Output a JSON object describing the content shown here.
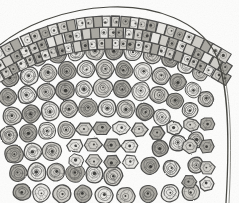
{
  "figure": {
    "kind": "histological-micrograph",
    "title": "",
    "caption": "",
    "label": "",
    "width_px": 239,
    "height_px": 203,
    "background_color": "#fdfdfc",
    "ink_color": "#4a4a48",
    "ink_color_dark": "#2b2b29",
    "fill_light": "#e8e7e3",
    "fill_mid": "#cfcdc7",
    "fill_dark": "#a9a7a0",
    "rendering": "grayscale line engraving / stipple"
  },
  "regions": [
    {
      "name": "epidermis",
      "description": "outer curved band of rectangular cells, 2 rows",
      "row_count": 2,
      "cell_shape": "rectangular"
    },
    {
      "name": "hypodermis",
      "description": "third row of smaller rectangular cells beneath epidermis",
      "row_count": 1,
      "cell_shape": "rectangular"
    },
    {
      "name": "cortex",
      "description": "bulk of section, rounded parenchyma cells with concentric rings and dark central nucleus",
      "cell_shape": "round-concentric"
    },
    {
      "name": "angular-cell-band",
      "description": "denser band of polygonal thick-walled cells in lower middle region",
      "cell_shape": "polygonal"
    }
  ],
  "epidermis_arc": {
    "row1_cells": 26,
    "row2_cells": 27,
    "row3_cells": 30,
    "arc_left_y": 46,
    "arc_peak_y": 11,
    "arc_right_y": 58
  },
  "cortex_cells": [
    {
      "x": 18,
      "y": 60,
      "r": 9.5,
      "rings": 3
    },
    {
      "x": 38,
      "y": 57,
      "r": 9,
      "rings": 3
    },
    {
      "x": 57,
      "y": 54,
      "r": 9.5,
      "rings": 3
    },
    {
      "x": 76,
      "y": 52,
      "r": 9,
      "rings": 3
    },
    {
      "x": 95,
      "y": 51,
      "r": 9.5,
      "rings": 3
    },
    {
      "x": 114,
      "y": 51,
      "r": 9,
      "rings": 3
    },
    {
      "x": 133,
      "y": 52,
      "r": 9.5,
      "rings": 3
    },
    {
      "x": 152,
      "y": 55,
      "r": 9,
      "rings": 3
    },
    {
      "x": 170,
      "y": 59,
      "r": 8.5,
      "rings": 3
    },
    {
      "x": 186,
      "y": 65,
      "r": 8.5,
      "rings": 3
    },
    {
      "x": 200,
      "y": 73,
      "r": 8,
      "rings": 3
    },
    {
      "x": 10,
      "y": 78,
      "r": 9,
      "rings": 3
    },
    {
      "x": 29,
      "y": 76,
      "r": 9.5,
      "rings": 3
    },
    {
      "x": 48,
      "y": 73,
      "r": 9,
      "rings": 3
    },
    {
      "x": 67,
      "y": 71,
      "r": 9.5,
      "rings": 3
    },
    {
      "x": 86,
      "y": 69,
      "r": 9,
      "rings": 3
    },
    {
      "x": 105,
      "y": 69,
      "r": 9.5,
      "rings": 3
    },
    {
      "x": 124,
      "y": 70,
      "r": 9,
      "rings": 3
    },
    {
      "x": 143,
      "y": 72,
      "r": 9.5,
      "rings": 3
    },
    {
      "x": 161,
      "y": 76,
      "r": 9,
      "rings": 3
    },
    {
      "x": 178,
      "y": 82,
      "r": 8.5,
      "rings": 3
    },
    {
      "x": 193,
      "y": 90,
      "r": 8,
      "rings": 3
    },
    {
      "x": 206,
      "y": 99,
      "r": 8,
      "rings": 3
    },
    {
      "x": 8,
      "y": 97,
      "r": 9,
      "rings": 3
    },
    {
      "x": 27,
      "y": 95,
      "r": 9.5,
      "rings": 3
    },
    {
      "x": 46,
      "y": 92,
      "r": 9,
      "rings": 3
    },
    {
      "x": 65,
      "y": 90,
      "r": 9.5,
      "rings": 3
    },
    {
      "x": 84,
      "y": 89,
      "r": 9,
      "rings": 3
    },
    {
      "x": 103,
      "y": 88,
      "r": 9.5,
      "rings": 3
    },
    {
      "x": 122,
      "y": 89,
      "r": 9,
      "rings": 3
    },
    {
      "x": 141,
      "y": 91,
      "r": 9.5,
      "rings": 3
    },
    {
      "x": 159,
      "y": 95,
      "r": 9,
      "rings": 3
    },
    {
      "x": 175,
      "y": 101,
      "r": 8.5,
      "rings": 3
    },
    {
      "x": 190,
      "y": 110,
      "r": 8,
      "rings": 3
    },
    {
      "x": 12,
      "y": 116,
      "r": 9.5,
      "rings": 3
    },
    {
      "x": 31,
      "y": 114,
      "r": 9,
      "rings": 3
    },
    {
      "x": 50,
      "y": 111,
      "r": 9.5,
      "rings": 3
    },
    {
      "x": 69,
      "y": 109,
      "r": 9,
      "rings": 3
    },
    {
      "x": 88,
      "y": 108,
      "r": 9.5,
      "rings": 3
    },
    {
      "x": 107,
      "y": 108,
      "r": 9,
      "rings": 3
    },
    {
      "x": 126,
      "y": 109,
      "r": 9.5,
      "rings": 3
    },
    {
      "x": 145,
      "y": 112,
      "r": 9,
      "rings": 3
    },
    {
      "x": 162,
      "y": 117,
      "r": 8.5,
      "rings": 3
    },
    {
      "x": 9,
      "y": 135,
      "r": 9,
      "rings": 3
    },
    {
      "x": 28,
      "y": 133,
      "r": 9.5,
      "rings": 3
    },
    {
      "x": 47,
      "y": 131,
      "r": 9,
      "rings": 3
    },
    {
      "x": 66,
      "y": 130,
      "r": 9,
      "rings": 3
    },
    {
      "x": 14,
      "y": 154,
      "r": 9.5,
      "rings": 3
    },
    {
      "x": 33,
      "y": 152,
      "r": 9,
      "rings": 3
    },
    {
      "x": 52,
      "y": 151,
      "r": 9.5,
      "rings": 3
    },
    {
      "x": 18,
      "y": 173,
      "r": 9,
      "rings": 3
    },
    {
      "x": 37,
      "y": 172,
      "r": 9.5,
      "rings": 3
    },
    {
      "x": 56,
      "y": 172,
      "r": 9,
      "rings": 3
    },
    {
      "x": 75,
      "y": 173,
      "r": 9.5,
      "rings": 3
    },
    {
      "x": 94,
      "y": 174,
      "r": 9,
      "rings": 3
    },
    {
      "x": 113,
      "y": 176,
      "r": 9.5,
      "rings": 3
    },
    {
      "x": 22,
      "y": 192,
      "r": 9,
      "rings": 2
    },
    {
      "x": 41,
      "y": 193,
      "r": 9,
      "rings": 2
    },
    {
      "x": 62,
      "y": 194,
      "r": 9,
      "rings": 2
    },
    {
      "x": 83,
      "y": 194,
      "r": 9,
      "rings": 2
    },
    {
      "x": 104,
      "y": 195,
      "r": 9,
      "rings": 2
    },
    {
      "x": 126,
      "y": 196,
      "r": 9,
      "rings": 2
    },
    {
      "x": 148,
      "y": 194,
      "r": 9,
      "rings": 2
    },
    {
      "x": 170,
      "y": 193,
      "r": 9,
      "rings": 2
    },
    {
      "x": 191,
      "y": 192,
      "r": 9,
      "rings": 2
    },
    {
      "x": 160,
      "y": 148,
      "r": 8.5,
      "rings": 3
    },
    {
      "x": 178,
      "y": 143,
      "r": 8.5,
      "rings": 3
    },
    {
      "x": 196,
      "y": 140,
      "r": 8,
      "rings": 3
    },
    {
      "x": 150,
      "y": 166,
      "r": 9,
      "rings": 3
    },
    {
      "x": 171,
      "y": 168,
      "r": 8.5,
      "rings": 3
    },
    {
      "x": 196,
      "y": 165,
      "r": 8,
      "rings": 3
    }
  ],
  "angular_cells": [
    {
      "x": 84,
      "y": 129,
      "w": 17,
      "h": 14
    },
    {
      "x": 102,
      "y": 128,
      "w": 18,
      "h": 14
    },
    {
      "x": 121,
      "y": 128,
      "w": 17,
      "h": 14
    },
    {
      "x": 139,
      "y": 130,
      "w": 17,
      "h": 14
    },
    {
      "x": 157,
      "y": 133,
      "w": 16,
      "h": 14
    },
    {
      "x": 174,
      "y": 128,
      "w": 16,
      "h": 14
    },
    {
      "x": 191,
      "y": 125,
      "w": 16,
      "h": 14
    },
    {
      "x": 207,
      "y": 124,
      "w": 15,
      "h": 14
    },
    {
      "x": 75,
      "y": 146,
      "w": 17,
      "h": 14
    },
    {
      "x": 93,
      "y": 145,
      "w": 18,
      "h": 14
    },
    {
      "x": 112,
      "y": 145,
      "w": 17,
      "h": 14
    },
    {
      "x": 130,
      "y": 146,
      "w": 17,
      "h": 14
    },
    {
      "x": 190,
      "y": 146,
      "w": 16,
      "h": 15
    },
    {
      "x": 207,
      "y": 146,
      "w": 15,
      "h": 15
    },
    {
      "x": 76,
      "y": 161,
      "w": 17,
      "h": 14
    },
    {
      "x": 94,
      "y": 161,
      "w": 17,
      "h": 14
    },
    {
      "x": 112,
      "y": 162,
      "w": 17,
      "h": 14
    },
    {
      "x": 130,
      "y": 162,
      "w": 16,
      "h": 14
    },
    {
      "x": 207,
      "y": 168,
      "w": 15,
      "h": 15
    },
    {
      "x": 189,
      "y": 182,
      "w": 16,
      "h": 14
    },
    {
      "x": 207,
      "y": 184,
      "w": 15,
      "h": 14
    }
  ]
}
